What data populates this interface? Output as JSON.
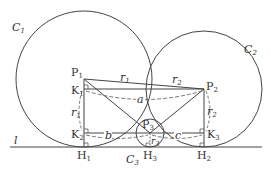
{
  "diagram": {
    "line": {
      "label": "l",
      "y": 147,
      "x1": 10,
      "x2": 262
    },
    "circles": [
      {
        "id": "C1",
        "label": "C",
        "sub": "1",
        "cx": 84,
        "cy": 79,
        "r": 68,
        "label_x": 12,
        "label_y": 31
      },
      {
        "id": "C2",
        "label": "C",
        "sub": "2",
        "cx": 204,
        "cy": 89,
        "r": 58,
        "label_x": 246,
        "label_y": 53
      },
      {
        "id": "C3",
        "label": "C",
        "sub": "3",
        "cx": 150,
        "cy": 133,
        "r": 14,
        "label_x": 124,
        "label_y": 163
      }
    ],
    "points": [
      {
        "id": "P1",
        "label": "P",
        "sub": "1",
        "x": 84,
        "y": 79,
        "lx": 71,
        "ly": 76
      },
      {
        "id": "P2",
        "label": "P",
        "sub": "2",
        "x": 204,
        "y": 89,
        "lx": 206,
        "ly": 90
      },
      {
        "id": "P3",
        "label": "P",
        "sub": "3",
        "x": 150,
        "y": 133,
        "lx": 142,
        "ly": 128
      },
      {
        "id": "K1",
        "label": "K",
        "sub": "1",
        "x": 84,
        "y": 89,
        "lx": 71,
        "ly": 94
      },
      {
        "id": "K2",
        "label": "K",
        "sub": "2",
        "x": 84,
        "y": 133,
        "lx": 71,
        "ly": 138
      },
      {
        "id": "K3",
        "label": "K",
        "sub": "3",
        "x": 204,
        "y": 133,
        "lx": 207,
        "ly": 138
      },
      {
        "id": "H1",
        "label": "H",
        "sub": "1",
        "x": 84,
        "y": 147,
        "lx": 77,
        "ly": 159
      },
      {
        "id": "H2",
        "label": "H",
        "sub": "2",
        "x": 204,
        "y": 147,
        "lx": 197,
        "ly": 159
      },
      {
        "id": "H3",
        "label": "H",
        "sub": "3",
        "x": 150,
        "y": 147,
        "lx": 143,
        "ly": 159
      }
    ],
    "lengths": [
      {
        "label": "r",
        "sub": "1",
        "x": 122,
        "y": 81
      },
      {
        "label": "r",
        "sub": "2",
        "x": 172,
        "y": 83
      },
      {
        "label": "r",
        "sub": "1",
        "x": 72,
        "y": 116
      },
      {
        "label": "r",
        "sub": "2",
        "x": 207,
        "y": 115
      },
      {
        "label": "r",
        "sub": "3",
        "x": 153,
        "y": 144
      },
      {
        "label": "a",
        "x": 139,
        "y": 103
      },
      {
        "label": "b",
        "x": 106,
        "y": 138
      },
      {
        "label": "c",
        "x": 177,
        "y": 138
      }
    ]
  }
}
